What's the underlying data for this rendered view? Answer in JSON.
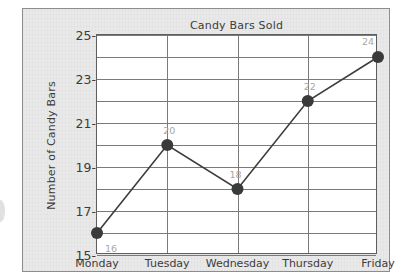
{
  "chart_data": {
    "type": "line",
    "title": "Candy Bars Sold",
    "xlabel": "",
    "ylabel": "Number of Candy Bars",
    "categories": [
      "Monday",
      "Tuesday",
      "Wednesday",
      "Thursday",
      "Friday"
    ],
    "values": [
      16,
      20,
      18,
      22,
      24
    ],
    "point_labels": [
      "16",
      "20",
      "18",
      "22",
      "24"
    ],
    "ylim": [
      15,
      25
    ],
    "y_tick_labels": [
      "25",
      "23",
      "21",
      "19",
      "17",
      "15"
    ],
    "y_tick_values": [
      25,
      23,
      21,
      19,
      17,
      15
    ],
    "y_gridline_values": [
      25,
      24,
      23,
      22,
      21,
      20,
      19,
      18,
      17,
      16,
      15
    ],
    "grid": true,
    "legend": false,
    "legend_position": "none",
    "series": [
      {
        "name": "Candy Bars Sold",
        "values": [
          16,
          20,
          18,
          22,
          24
        ]
      }
    ]
  },
  "style": {
    "line_color": "#3d3d3d",
    "marker_color": "#3a3a3a",
    "grid_color": "#7a7a7a",
    "axis_color": "#5e5e5e",
    "text_color": "#3c3c3c",
    "label_color": "#a7a7a7",
    "plot_background": "#ffffff",
    "page_background": "#e9e9e9"
  }
}
